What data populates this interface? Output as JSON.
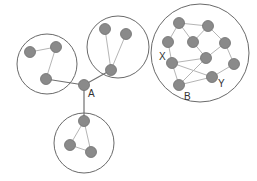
{
  "diagram": {
    "type": "network-communities",
    "colors": {
      "node_fill": "#8a8a8a",
      "node_stroke": "#6e6e6e",
      "edge": "#b5b5b5",
      "bridge_edge": "#707070",
      "community_circle": "#6a6a6a",
      "label": "#333333"
    },
    "communities": [
      {
        "id": "left",
        "cx": 47,
        "cy": 64,
        "r": 30
      },
      {
        "id": "top",
        "cx": 118,
        "cy": 47,
        "r": 31
      },
      {
        "id": "bottom",
        "cx": 84,
        "cy": 143,
        "r": 30
      },
      {
        "id": "right",
        "cx": 200,
        "cy": 53,
        "r": 49
      }
    ],
    "nodes": [
      {
        "id": "l1",
        "x": 30,
        "y": 52
      },
      {
        "id": "l2",
        "x": 56,
        "y": 47
      },
      {
        "id": "l3",
        "x": 46,
        "y": 79
      },
      {
        "id": "t1",
        "x": 105,
        "y": 29
      },
      {
        "id": "t2",
        "x": 126,
        "y": 34
      },
      {
        "id": "t3",
        "x": 111,
        "y": 70
      },
      {
        "id": "A",
        "x": 84,
        "y": 85
      },
      {
        "id": "b1",
        "x": 84,
        "y": 121
      },
      {
        "id": "b2",
        "x": 70,
        "y": 145
      },
      {
        "id": "b3",
        "x": 91,
        "y": 152
      },
      {
        "id": "r1",
        "x": 179,
        "y": 23
      },
      {
        "id": "r2",
        "x": 208,
        "y": 26
      },
      {
        "id": "r3",
        "x": 168,
        "y": 42
      },
      {
        "id": "r4",
        "x": 193,
        "y": 42
      },
      {
        "id": "r5",
        "x": 225,
        "y": 43
      },
      {
        "id": "C",
        "x": 206,
        "y": 58
      },
      {
        "id": "r7",
        "x": 234,
        "y": 64
      },
      {
        "id": "X",
        "x": 172,
        "y": 63
      },
      {
        "id": "B",
        "x": 179,
        "y": 85
      },
      {
        "id": "Y",
        "x": 212,
        "y": 77
      }
    ],
    "edges": [
      {
        "from": "l1",
        "to": "l2"
      },
      {
        "from": "l2",
        "to": "l3"
      },
      {
        "from": "t1",
        "to": "t3"
      },
      {
        "from": "t2",
        "to": "t3"
      },
      {
        "from": "b1",
        "to": "b2"
      },
      {
        "from": "b1",
        "to": "b3"
      },
      {
        "from": "b2",
        "to": "b3"
      },
      {
        "from": "r1",
        "to": "r2"
      },
      {
        "from": "r1",
        "to": "r3"
      },
      {
        "from": "r1",
        "to": "r4"
      },
      {
        "from": "r2",
        "to": "r4"
      },
      {
        "from": "r2",
        "to": "r5"
      },
      {
        "from": "r3",
        "to": "X"
      },
      {
        "from": "r4",
        "to": "C"
      },
      {
        "from": "r5",
        "to": "C"
      },
      {
        "from": "r5",
        "to": "r7"
      },
      {
        "from": "r7",
        "to": "Y"
      },
      {
        "from": "C",
        "to": "X"
      },
      {
        "from": "C",
        "to": "B"
      },
      {
        "from": "X",
        "to": "Y"
      },
      {
        "from": "X",
        "to": "B"
      },
      {
        "from": "B",
        "to": "Y"
      }
    ],
    "bridge_edges": [
      {
        "from": "l3",
        "to": "A"
      },
      {
        "from": "t3",
        "to": "A"
      },
      {
        "from": "A",
        "to": "b1"
      }
    ],
    "labels": [
      {
        "text": "A",
        "x": 88,
        "y": 89
      },
      {
        "text": "X",
        "x": 159,
        "y": 52
      },
      {
        "text": "B",
        "x": 184,
        "y": 92
      },
      {
        "text": "Y",
        "x": 218,
        "y": 79
      }
    ]
  }
}
